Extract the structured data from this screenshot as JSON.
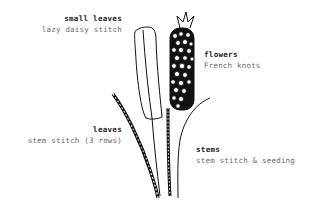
{
  "labels": {
    "small_leaves": {
      "title": "small leaves",
      "stitch": "lazy daisy stitch"
    },
    "flowers": {
      "title": "flowers",
      "stitch": "French knots"
    },
    "leaves": {
      "title": "leaves",
      "stitch": "stem stitch (3 rows)"
    },
    "stems": {
      "title": "stems",
      "stitch": "stem stitch & seeding"
    }
  },
  "colors": {
    "ink": "#111111",
    "title_text": "#222222",
    "subtitle_text": "#6a6a6a",
    "background": "#ffffff"
  }
}
